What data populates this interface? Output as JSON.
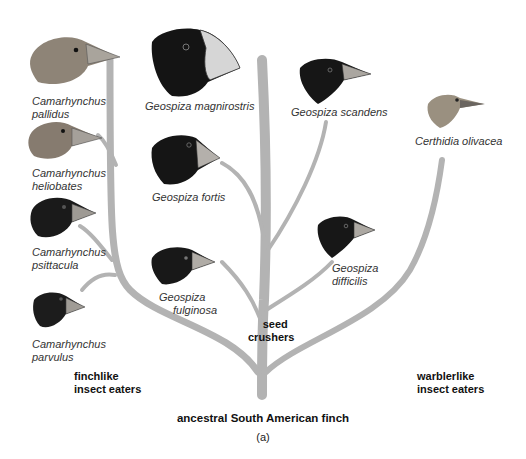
{
  "figure": {
    "title": "ancestral South American finch",
    "panel": "(a)",
    "branch_color": "#b0b0b0"
  },
  "groups": {
    "finchlike": [
      "finchlike",
      "insect eaters"
    ],
    "seed": [
      "seed",
      "crushers"
    ],
    "warblerlike": [
      "warblerlike",
      "insect eaters"
    ]
  },
  "species": [
    {
      "id": "c-pallidus",
      "lines": [
        "Camarhynchus",
        "pallidus"
      ],
      "head": "#8a7f72",
      "group": "finchlike insect eaters"
    },
    {
      "id": "c-heliobates",
      "lines": [
        "Camarhynchus",
        "heliobates"
      ],
      "head": "#857a6e",
      "group": "finchlike insect eaters"
    },
    {
      "id": "c-psittacula",
      "lines": [
        "Camarhynchus",
        "psittacula"
      ],
      "head": "#1a1a1a",
      "group": "finchlike insect eaters"
    },
    {
      "id": "c-parvulus",
      "lines": [
        "Camarhynchus",
        "parvulus"
      ],
      "head": "#1c1c1c",
      "group": "finchlike insect eaters"
    },
    {
      "id": "g-magnirostris",
      "lines": [
        "Geospiza magnirostris"
      ],
      "head": "#141414",
      "group": "seed crushers"
    },
    {
      "id": "g-fortis",
      "lines": [
        "Geospiza fortis"
      ],
      "head": "#151515",
      "group": "seed crushers"
    },
    {
      "id": "g-fulginosa",
      "lines": [
        "Geospiza",
        "fulginosa"
      ],
      "head": "#181818",
      "group": "seed crushers"
    },
    {
      "id": "g-scandens",
      "lines": [
        "Geospiza scandens"
      ],
      "head": "#161616",
      "group": "seed crushers"
    },
    {
      "id": "g-difficilis",
      "lines": [
        "Geospiza",
        "difficilis"
      ],
      "head": "#171717",
      "group": "seed crushers"
    },
    {
      "id": "c-olivacea",
      "lines": [
        "Certhidia olivacea"
      ],
      "head": "#9a9080",
      "group": "warblerlike insect eaters"
    }
  ]
}
